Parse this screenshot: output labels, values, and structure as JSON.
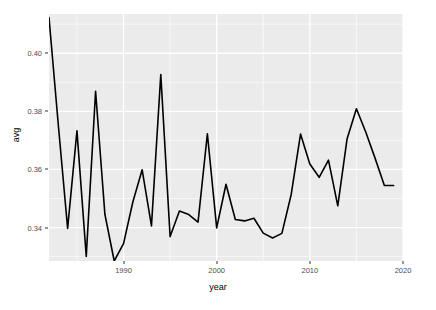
{
  "chart_data": {
    "type": "line",
    "title": "",
    "subtitle": "",
    "xlabel": "year",
    "ylabel": "avg",
    "xlim": [
      1982,
      2020
    ],
    "ylim": [
      0.3285,
      0.4135
    ],
    "grid": true,
    "legend": null,
    "x_ticks": [
      1990,
      2000,
      2010,
      2020
    ],
    "x_tick_labels": [
      "1990",
      "2000",
      "2010",
      "2020"
    ],
    "y_ticks": [
      0.34,
      0.36,
      0.38,
      0.4
    ],
    "y_tick_labels": [
      "0.34",
      "0.36",
      "0.38",
      "0.40"
    ],
    "y_minor_ticks": [
      0.33,
      0.35,
      0.37,
      0.39,
      0.41
    ],
    "x_minor_ticks": [
      1985,
      1995,
      2005,
      2015
    ],
    "line_color": "#000000",
    "line_width": 1.6,
    "panel_background": "#ebebeb",
    "gridline_color": "#ffffff",
    "x": [
      1982,
      1983,
      1984,
      1985,
      1986,
      1987,
      1988,
      1989,
      1990,
      1991,
      1992,
      1993,
      1994,
      1995,
      1996,
      1997,
      1998,
      1999,
      2000,
      2001,
      2002,
      2003,
      2004,
      2005,
      2006,
      2007,
      2008,
      2009,
      2010,
      2011,
      2012,
      2013,
      2014,
      2015,
      2016,
      2017,
      2018,
      2019
    ],
    "values": [
      0.4123,
      0.3753,
      0.3397,
      0.3733,
      0.3301,
      0.3869,
      0.3446,
      0.3285,
      0.3345,
      0.3488,
      0.3599,
      0.3406,
      0.3927,
      0.3369,
      0.3457,
      0.3445,
      0.3419,
      0.3723,
      0.3399,
      0.3549,
      0.3428,
      0.3423,
      0.3432,
      0.3381,
      0.3364,
      0.338,
      0.3514,
      0.3722,
      0.3619,
      0.3573,
      0.3632,
      0.3475,
      0.3706,
      0.3809,
      0.3729,
      0.3639,
      0.3545,
      0.3545
    ]
  }
}
